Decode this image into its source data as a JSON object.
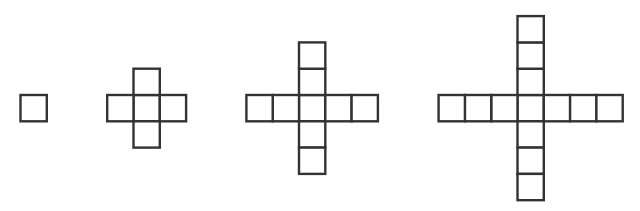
{
  "diagram": {
    "stroke_color": "#333333",
    "background_color": "#ffffff",
    "figures": [
      {
        "label": "figure-1",
        "arm_length": 0,
        "square_count": 1
      },
      {
        "label": "figure-2",
        "arm_length": 1,
        "square_count": 5
      },
      {
        "label": "figure-3",
        "arm_length": 2,
        "square_count": 9
      },
      {
        "label": "figure-4",
        "arm_length": 3,
        "square_count": 13
      }
    ]
  }
}
